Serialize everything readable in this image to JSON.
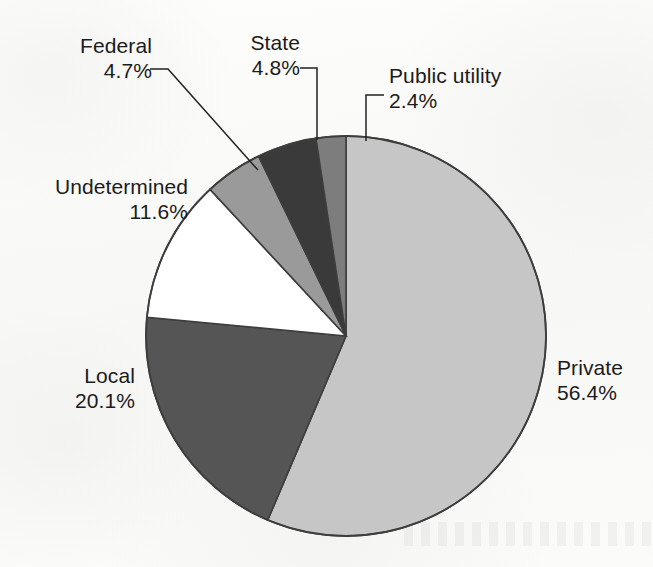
{
  "figure": {
    "kind": "pie-chart",
    "background_color": "#fbfbfa",
    "text_color": "#1b1b1b"
  },
  "chart_data": {
    "type": "pie",
    "title": "",
    "subtitle": "",
    "xlabel": "",
    "ylabel": "",
    "grid": false,
    "legend_position": "none",
    "label_format": "name + percentage",
    "units": "percent",
    "start_angle_deg": 0,
    "direction": "clockwise",
    "categories": [
      "Private",
      "Local",
      "Undetermined",
      "Federal",
      "State",
      "Public utility"
    ],
    "values": [
      56.4,
      20.1,
      11.6,
      4.7,
      4.8,
      2.4
    ],
    "colors": [
      "#c6c6c6",
      "#555555",
      "#ffffff",
      "#9a9a9a",
      "#3a3a3a",
      "#7d7d7d"
    ],
    "slices": [
      {
        "label": "Private",
        "value": 56.4,
        "value_text": "56.4%",
        "color": "#c6c6c6",
        "leader_line": false
      },
      {
        "label": "Local",
        "value": 20.1,
        "value_text": "20.1%",
        "color": "#555555",
        "leader_line": false
      },
      {
        "label": "Undetermined",
        "value": 11.6,
        "value_text": "11.6%",
        "color": "#ffffff",
        "leader_line": false
      },
      {
        "label": "Federal",
        "value": 4.7,
        "value_text": "4.7%",
        "color": "#9a9a9a",
        "leader_line": true
      },
      {
        "label": "State",
        "value": 4.8,
        "value_text": "4.8%",
        "color": "#3a3a3a",
        "leader_line": true
      },
      {
        "label": "Public utility",
        "value": 2.4,
        "value_text": "2.4%",
        "color": "#7d7d7d",
        "leader_line": true
      }
    ]
  },
  "labels": {
    "federal": {
      "name": "Federal",
      "pct": "4.7%"
    },
    "state": {
      "name": "State",
      "pct": "4.8%"
    },
    "public_utility": {
      "name": "Public utility",
      "pct": "2.4%"
    },
    "undetermined": {
      "name": "Undetermined",
      "pct": "11.6%"
    },
    "local": {
      "name": "Local",
      "pct": "20.1%"
    },
    "private": {
      "name": "Private",
      "pct": "56.4%"
    }
  }
}
